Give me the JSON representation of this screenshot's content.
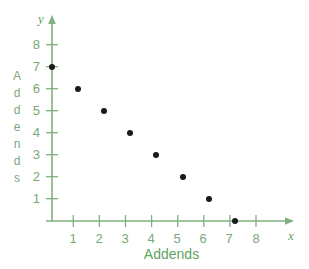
{
  "chart_data": {
    "type": "scatter",
    "title": "",
    "xlabel": "Addends",
    "ylabel": "Addends",
    "x_axis_letter": "x",
    "y_axis_letter": "y",
    "xlim": [
      0,
      9
    ],
    "ylim": [
      0,
      9
    ],
    "x_ticks": [
      1,
      2,
      3,
      4,
      5,
      6,
      7,
      8
    ],
    "y_ticks": [
      1,
      2,
      3,
      4,
      5,
      6,
      7,
      8
    ],
    "x_tick_labels": [
      "1",
      "2",
      "3",
      "4",
      "5",
      "6",
      "7",
      "8"
    ],
    "y_tick_labels": [
      "1",
      "2",
      "3",
      "4",
      "5",
      "6",
      "7",
      "8"
    ],
    "grid": false,
    "legend": null,
    "series": [
      {
        "name": "Addend pairs summing to 7",
        "marker": "filled-circle",
        "color": "#1a1a1a",
        "points": [
          {
            "x": 0,
            "y": 7
          },
          {
            "x": 1,
            "y": 6
          },
          {
            "x": 2,
            "y": 5
          },
          {
            "x": 3,
            "y": 4
          },
          {
            "x": 4,
            "y": 3
          },
          {
            "x": 5,
            "y": 2
          },
          {
            "x": 6,
            "y": 1
          },
          {
            "x": 7,
            "y": 0
          }
        ]
      }
    ],
    "colors": {
      "axis": "#7fb07f",
      "tick_label": "#79a979",
      "axis_letter": "#5e9e5e",
      "axis_title": "#5fa35f",
      "marker": "#1a1a1a",
      "background": "#ffffff"
    }
  }
}
